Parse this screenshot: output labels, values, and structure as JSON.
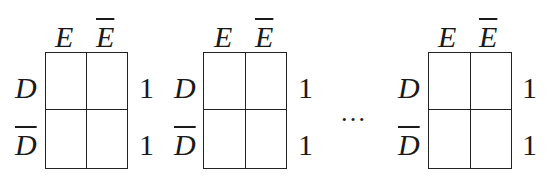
{
  "diagram": {
    "type": "karnaugh-map-sequence",
    "maps": [
      {
        "column_labels": [
          "E",
          "E"
        ],
        "column_overline": [
          false,
          true
        ],
        "row_labels": [
          "D",
          "D"
        ],
        "row_overline": [
          false,
          true
        ],
        "row_values": [
          "1",
          "1"
        ],
        "cells": [
          [
            "",
            ""
          ],
          [
            "",
            ""
          ]
        ]
      },
      {
        "column_labels": [
          "E",
          "E"
        ],
        "column_overline": [
          false,
          true
        ],
        "row_labels": [
          "D",
          "D"
        ],
        "row_overline": [
          false,
          true
        ],
        "row_values": [
          "1",
          "1"
        ],
        "cells": [
          [
            "",
            ""
          ],
          [
            "",
            ""
          ]
        ]
      },
      {
        "column_labels": [
          "E",
          "E"
        ],
        "column_overline": [
          false,
          true
        ],
        "row_labels": [
          "D",
          "D"
        ],
        "row_overline": [
          false,
          true
        ],
        "row_values": [
          "1",
          "1"
        ],
        "cells": [
          [
            "",
            ""
          ],
          [
            "",
            ""
          ]
        ]
      }
    ],
    "ellipsis": "…"
  }
}
